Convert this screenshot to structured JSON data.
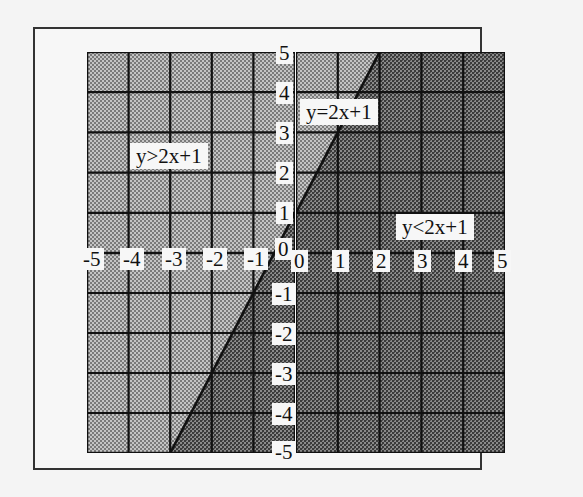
{
  "chart_data": {
    "type": "area",
    "title": "",
    "xlabel": "",
    "ylabel": "",
    "xlim": [
      -5,
      5
    ],
    "ylim": [
      -5,
      5
    ],
    "grid": true,
    "x_ticks": [
      "-5",
      "-4",
      "-3",
      "-2",
      "-1",
      "0",
      "0",
      "1",
      "2",
      "3",
      "4",
      "5"
    ],
    "y_ticks": [
      "5",
      "4",
      "3",
      "2",
      "1",
      "0",
      "-1",
      "-2",
      "-3",
      "-4",
      "-5"
    ],
    "line": {
      "label": "y=2x+1",
      "slope": 2,
      "intercept": 1,
      "points": [
        [
          -3,
          -5
        ],
        [
          2,
          5
        ]
      ]
    },
    "regions": [
      {
        "label": "y>2x+1",
        "side": "above",
        "shade": "light"
      },
      {
        "label": "y<2x+1",
        "side": "below",
        "shade": "dark"
      }
    ],
    "annotations": [
      "y>2x+1",
      "y=2x+1",
      "y<2x+1"
    ]
  },
  "labels": {
    "above": "y>2x+1",
    "line": "y=2x+1",
    "below": "y<2x+1"
  },
  "colors": {
    "light_shade": "#a9a9a9",
    "dark_shade": "#6e6e6e",
    "grid": "#111111",
    "label_bg": "#f7f7f7"
  }
}
